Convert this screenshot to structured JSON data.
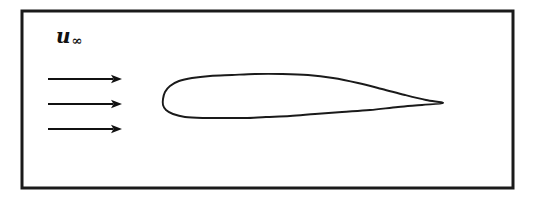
{
  "figure": {
    "domain_type": "diagram",
    "background_color": "#ffffff",
    "stroke_color": "#1a1a1a",
    "canvas": {
      "width": 533,
      "height": 200
    }
  },
  "frame": {
    "name": "flow-domain-boundary",
    "shape": "rectangle",
    "x": 22,
    "y": 11,
    "width": 491,
    "height": 177,
    "stroke_width": 3,
    "stroke_color": "#1a1a1a",
    "fill": "none"
  },
  "freestream": {
    "label_u": "u",
    "label_subscript": "∞",
    "label_full": "u∞",
    "label_x": 56,
    "label_y": 26,
    "arrow_count": 3,
    "arrow_color": "#111111",
    "arrow_line_width": 1.8,
    "arrows": [
      {
        "name": "freestream-arrow-1",
        "x1": 48,
        "y1": 79,
        "x2": 122,
        "y2": 79
      },
      {
        "name": "freestream-arrow-2",
        "x1": 48,
        "y1": 104,
        "x2": 122,
        "y2": 104
      },
      {
        "name": "freestream-arrow-3",
        "x1": 48,
        "y1": 129,
        "x2": 122,
        "y2": 129
      }
    ]
  },
  "airfoil": {
    "name": "airfoil-profile",
    "leading_edge": {
      "x": 163,
      "y": 99
    },
    "trailing_edge": {
      "x": 443,
      "y": 103
    },
    "chord_length": 280,
    "max_thickness": 44,
    "upper_crest": {
      "x": 282,
      "y": 74
    },
    "lower_crest": {
      "x": 258,
      "y": 118
    },
    "stroke_width": 1.9,
    "stroke_color": "#1a1a1a",
    "fill": "none",
    "upper_surface_points": [
      [
        163,
        99
      ],
      [
        165,
        92
      ],
      [
        170,
        86
      ],
      [
        179,
        81
      ],
      [
        192,
        78
      ],
      [
        210,
        76
      ],
      [
        232,
        75
      ],
      [
        255,
        74
      ],
      [
        282,
        74
      ],
      [
        308,
        75
      ],
      [
        333,
        78
      ],
      [
        358,
        83
      ],
      [
        382,
        89
      ],
      [
        405,
        95
      ],
      [
        426,
        100
      ],
      [
        443,
        103
      ]
    ],
    "lower_surface_points": [
      [
        163,
        99
      ],
      [
        163,
        105
      ],
      [
        166,
        110
      ],
      [
        173,
        114
      ],
      [
        185,
        117
      ],
      [
        203,
        118
      ],
      [
        224,
        118
      ],
      [
        245,
        118
      ],
      [
        266,
        117
      ],
      [
        290,
        116
      ],
      [
        315,
        114
      ],
      [
        342,
        112
      ],
      [
        370,
        110
      ],
      [
        398,
        107
      ],
      [
        422,
        105
      ],
      [
        443,
        103
      ]
    ]
  },
  "chart_data": {
    "type": "line",
    "xlabel": "",
    "ylabel": "",
    "series": [
      {
        "name": "airfoil-upper-surface",
        "x": [
          163,
          165,
          170,
          179,
          192,
          210,
          232,
          255,
          282,
          308,
          333,
          358,
          382,
          405,
          426,
          443
        ],
        "y": [
          99,
          92,
          86,
          81,
          78,
          76,
          75,
          74,
          74,
          75,
          78,
          83,
          89,
          95,
          100,
          103
        ]
      },
      {
        "name": "airfoil-lower-surface",
        "x": [
          163,
          163,
          166,
          173,
          185,
          203,
          224,
          245,
          266,
          290,
          315,
          342,
          370,
          398,
          422,
          443
        ],
        "y": [
          99,
          105,
          110,
          114,
          117,
          118,
          118,
          118,
          117,
          116,
          114,
          112,
          110,
          107,
          105,
          103
        ]
      }
    ],
    "annotations": [
      {
        "text": "u∞",
        "x": 56,
        "y": 26
      }
    ],
    "grid": false,
    "legend": "none"
  }
}
